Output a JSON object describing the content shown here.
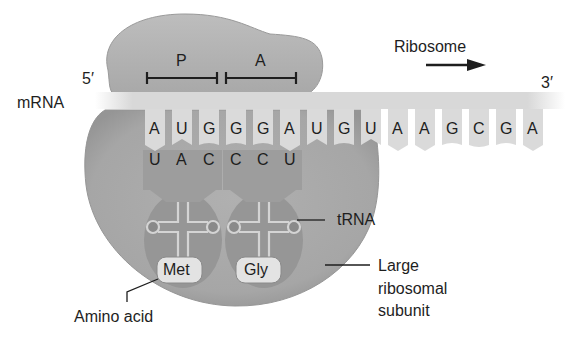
{
  "labels": {
    "five_prime": "5′",
    "three_prime": "3′",
    "mrna": "mRNA",
    "ribosome": "Ribosome",
    "p_site": "P",
    "a_site": "A",
    "trna": "tRNA",
    "large_subunit_line1": "Large",
    "large_subunit_line2": "ribosomal",
    "large_subunit_line3": "subunit",
    "amino_acid": "Amino acid"
  },
  "mrna_codons": [
    "A",
    "U",
    "G",
    "G",
    "G",
    "A",
    "U",
    "G",
    "U",
    "A",
    "A",
    "G",
    "C",
    "G",
    "A"
  ],
  "anticodons": [
    "U",
    "A",
    "C",
    "C",
    "C",
    "U"
  ],
  "amino_acids": [
    "Met",
    "Gly"
  ],
  "colors": {
    "ribosome": "#a9a9a9",
    "ribosome_dark": "#8f8f8f",
    "mrna_strand": "#d6d6d6",
    "base_tab": "#d9d9d9",
    "trna_body": "#9a9a9a",
    "anticodon_tab": "#a5a5a5",
    "aa_box": "#e4e4e4",
    "text": "#1e1e1e"
  }
}
